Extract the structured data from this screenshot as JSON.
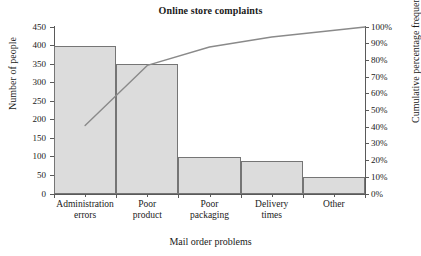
{
  "chart_data": {
    "type": "bar",
    "title": "Online store complaints",
    "xlabel": "Mail order problems",
    "ylabel": "Number of people",
    "y2label": "Cumulative percentage frequency",
    "categories": [
      "Administration errors",
      "Poor product",
      "Poor packaging",
      "Delivery times",
      "Other"
    ],
    "category_lines": [
      [
        "Administration",
        "errors"
      ],
      [
        "Poor",
        "product"
      ],
      [
        "Poor",
        "packaging"
      ],
      [
        "Delivery",
        "times"
      ],
      [
        "Other",
        ""
      ]
    ],
    "values": [
      400,
      350,
      100,
      88,
      47
    ],
    "ylim": [
      0,
      450
    ],
    "yticks": [
      0,
      50,
      100,
      150,
      200,
      250,
      300,
      350,
      400,
      450
    ],
    "ytick_labels": [
      "0",
      "50",
      "100",
      "150",
      "200",
      "250",
      "300",
      "350",
      "400",
      "450"
    ],
    "y2lim": [
      0,
      100
    ],
    "y2ticks": [
      0,
      10,
      20,
      30,
      40,
      50,
      60,
      70,
      80,
      90,
      100
    ],
    "y2tick_labels": [
      "0%",
      "10%",
      "20%",
      "30%",
      "40%",
      "50%",
      "60%",
      "70%",
      "80%",
      "90%",
      "100%"
    ],
    "series": [
      {
        "name": "Number of people",
        "type": "bar",
        "axis": "left",
        "values": [
          400,
          350,
          100,
          88,
          47
        ]
      },
      {
        "name": "Cumulative percentage frequency",
        "type": "line",
        "axis": "right",
        "values": [
          41,
          77,
          88,
          94,
          100
        ]
      }
    ],
    "grid": false,
    "legend": "none",
    "colors": {
      "bar_fill": "#dcdcdc",
      "bar_edge": "#757575",
      "line": "#8a8a8a",
      "axis": "#5a5a5a",
      "text": "#1a1a1a",
      "background": "#ffffff"
    }
  }
}
